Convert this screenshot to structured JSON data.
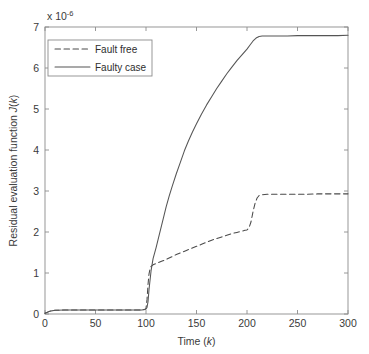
{
  "chart_data": {
    "type": "line",
    "title": "",
    "xlabel": "Time (k)",
    "ylabel": "Residual evaluation function J(k)",
    "y_exponent_label": "x 10",
    "y_exponent_value": "-6",
    "xlim": [
      0,
      300
    ],
    "ylim": [
      0,
      7
    ],
    "xticks": [
      0,
      50,
      100,
      150,
      200,
      250,
      300
    ],
    "xticklabels": [
      "0",
      "50",
      "100",
      "150",
      "200",
      "250",
      "300"
    ],
    "yticks": [
      0,
      1,
      2,
      3,
      4,
      5,
      6,
      7
    ],
    "yticklabels": [
      "0",
      "1",
      "2",
      "3",
      "4",
      "5",
      "6",
      "7"
    ],
    "grid": false,
    "legend_position": "upper left",
    "series": [
      {
        "name": "Fault free",
        "style": "dashed",
        "color": "#4a4a4a",
        "x": [
          0,
          5,
          10,
          20,
          30,
          40,
          50,
          60,
          70,
          80,
          90,
          96,
          99,
          100,
          101,
          102,
          103,
          104,
          105,
          107,
          110,
          113,
          116,
          120,
          125,
          130,
          135,
          140,
          145,
          150,
          155,
          160,
          165,
          170,
          175,
          180,
          185,
          190,
          195,
          198,
          200,
          202,
          204,
          206,
          208,
          210,
          212,
          215,
          220,
          230,
          240,
          250,
          260,
          270,
          280,
          290,
          300
        ],
        "y": [
          0.02,
          0.07,
          0.09,
          0.1,
          0.1,
          0.1,
          0.1,
          0.1,
          0.1,
          0.1,
          0.1,
          0.1,
          0.11,
          0.14,
          0.35,
          0.72,
          0.98,
          1.1,
          1.16,
          1.2,
          1.23,
          1.26,
          1.29,
          1.33,
          1.39,
          1.45,
          1.5,
          1.55,
          1.6,
          1.65,
          1.7,
          1.75,
          1.8,
          1.84,
          1.88,
          1.92,
          1.96,
          1.99,
          2.02,
          2.04,
          2.05,
          2.1,
          2.25,
          2.5,
          2.7,
          2.83,
          2.89,
          2.91,
          2.92,
          2.92,
          2.92,
          2.92,
          2.92,
          2.93,
          2.93,
          2.93,
          2.93
        ]
      },
      {
        "name": "Faulty case",
        "style": "solid",
        "color": "#555555",
        "x": [
          0,
          5,
          10,
          20,
          30,
          40,
          50,
          60,
          70,
          80,
          90,
          96,
          100,
          101,
          102,
          103,
          105,
          107,
          110,
          112,
          115,
          118,
          120,
          123,
          126,
          130,
          134,
          138,
          142,
          146,
          150,
          155,
          160,
          165,
          170,
          175,
          180,
          185,
          190,
          195,
          200,
          203,
          206,
          209,
          212,
          215,
          220,
          230,
          240,
          250,
          260,
          270,
          280,
          290,
          300
        ],
        "y": [
          0.02,
          0.07,
          0.09,
          0.1,
          0.1,
          0.1,
          0.1,
          0.1,
          0.1,
          0.1,
          0.1,
          0.1,
          0.12,
          0.16,
          0.3,
          0.6,
          1.05,
          1.35,
          1.62,
          1.82,
          2.12,
          2.42,
          2.62,
          2.88,
          3.12,
          3.42,
          3.7,
          3.98,
          4.22,
          4.44,
          4.64,
          4.88,
          5.1,
          5.3,
          5.5,
          5.68,
          5.86,
          6.02,
          6.18,
          6.32,
          6.46,
          6.56,
          6.66,
          6.73,
          6.77,
          6.78,
          6.78,
          6.78,
          6.78,
          6.79,
          6.79,
          6.79,
          6.79,
          6.79,
          6.8
        ]
      }
    ],
    "legend_entries": [
      {
        "label": "Fault free",
        "style": "dashed"
      },
      {
        "label": "Faulty case",
        "style": "solid"
      }
    ]
  },
  "axes_geometry": {
    "left": 45,
    "right": 348,
    "top": 27,
    "bottom": 314
  },
  "legend_geometry": {
    "x": 48,
    "y": 40,
    "width": 104,
    "height": 36
  }
}
